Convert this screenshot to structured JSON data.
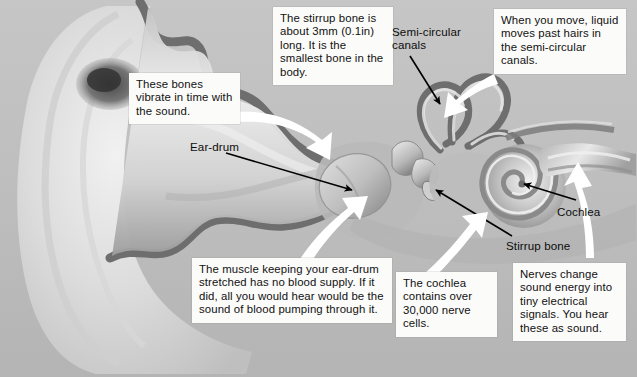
{
  "figure": {
    "type": "anatomical-diagram"
  },
  "callouts": [
    {
      "id": "stirrup_fact",
      "text": "The stirrup bone is about 3mm (0.1in) long. It is the smallest bone in the body."
    },
    {
      "id": "move_fact",
      "text": "When you move, liquid moves past hairs in the semi-circular canals."
    },
    {
      "id": "bones_fact",
      "text": "These bones vibrate in time with the sound."
    },
    {
      "id": "muscle_fact",
      "text": "The muscle keeping your ear-drum stretched has no blood supply. If it did, all you would hear would be the sound of blood pumping through it."
    },
    {
      "id": "cochlea_fact",
      "text": "The cochlea contains over 30,000 nerve cells."
    },
    {
      "id": "nerves_fact",
      "text": "Nerves change sound energy into tiny electrical signals. You hear these as sound."
    }
  ],
  "labels": [
    {
      "id": "semicircular_canals",
      "text": "Semi-circular\ncanals"
    },
    {
      "id": "eardrum",
      "text": "Ear-drum"
    },
    {
      "id": "cochlea",
      "text": "Cochlea"
    },
    {
      "id": "stirrup_bone",
      "text": "Stirrup bone"
    }
  ],
  "colors": {
    "background": "#bcbcbc",
    "canal_outline": "#6c6c6c",
    "tissue_light": "#e3e3e3",
    "tissue_mid": "#a9a9a9",
    "tissue_dark": "#747474",
    "callout_bg": "#fbfbfa",
    "text": "#111111",
    "pointer_white": "#ffffff",
    "pointer_black": "#000000"
  }
}
